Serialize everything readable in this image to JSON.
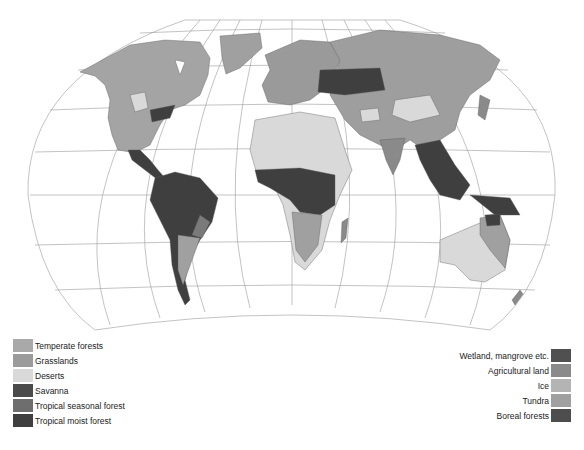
{
  "map": {
    "projection": "Robinson-style world map",
    "graticule": true,
    "colors": {
      "ocean": "#ffffff",
      "graticule": "#9a9a9a",
      "border": "#5a5a5a"
    }
  },
  "legend": {
    "left": [
      {
        "label": "Temperate forests",
        "color": "#a9a9a9"
      },
      {
        "label": "Grasslands",
        "color": "#9b9b9b"
      },
      {
        "label": "Deserts",
        "color": "#d9d9d9"
      },
      {
        "label": "Savanna",
        "color": "#4a4a4a"
      },
      {
        "label": "Tropical seasonal forest",
        "color": "#6e6e6e"
      },
      {
        "label": "Tropical moist forest",
        "color": "#3f3f3f"
      }
    ],
    "right": [
      {
        "label": "Wetland, mangrove etc.",
        "color": "#505050"
      },
      {
        "label": "Agricultural land",
        "color": "#8a8a8a"
      },
      {
        "label": "Ice",
        "color": "#b4b4b4"
      },
      {
        "label": "Tundra",
        "color": "#a0a0a0"
      },
      {
        "label": "Boreal forests",
        "color": "#4d4d4d"
      }
    ]
  }
}
